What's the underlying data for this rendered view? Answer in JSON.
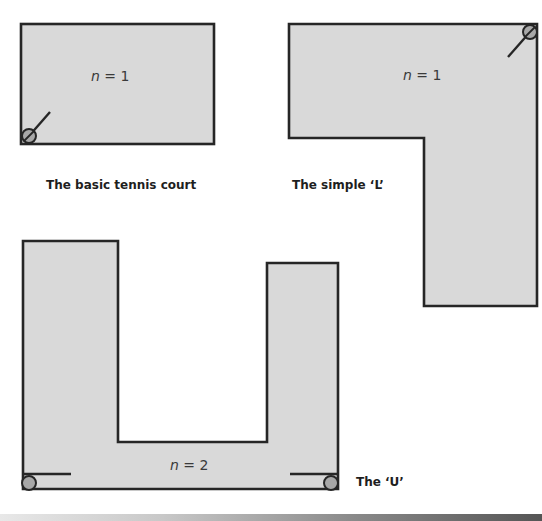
{
  "diagrams": [
    {
      "id": "basic",
      "caption": "The basic tennis court",
      "label_var": "n",
      "label_rest": " = 1",
      "sprinkler_count": 1
    },
    {
      "id": "l-shape",
      "caption": "The simple ‘L’",
      "label_var": "n",
      "label_rest": " = 1",
      "sprinkler_count": 1
    },
    {
      "id": "u-shape",
      "caption": "The ‘U’",
      "label_var": "n",
      "label_rest": " = 2",
      "sprinkler_count": 2
    }
  ],
  "colors": {
    "fill": "#d9d9d9",
    "stroke": "#262626",
    "sprinkler": "#a8a8a8"
  }
}
